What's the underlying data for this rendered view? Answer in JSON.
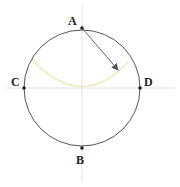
{
  "diagram": {
    "center": {
      "x": 82,
      "y": 88
    },
    "radius": 58,
    "colors": {
      "circle": "#555555",
      "axes": "#d8d8d8",
      "arc": "#ece6b0",
      "arrow": "#555555",
      "point": "#222222"
    },
    "points": [
      {
        "id": "A",
        "label": "A",
        "x": 82,
        "y": 28,
        "lx": 70,
        "ly": 25
      },
      {
        "id": "B",
        "label": "B",
        "x": 82,
        "y": 148,
        "lx": 76,
        "ly": 164
      },
      {
        "id": "C",
        "label": "C",
        "x": 24,
        "y": 88,
        "lx": 12,
        "ly": 85
      },
      {
        "id": "D",
        "label": "D",
        "x": 140,
        "y": 88,
        "lx": 144,
        "ly": 85
      }
    ],
    "arrow": {
      "from": "A",
      "x1": 82,
      "y1": 28,
      "x2": 118,
      "y2": 70
    },
    "arc_path": "M 32 60 Q 82 112 128 62"
  }
}
